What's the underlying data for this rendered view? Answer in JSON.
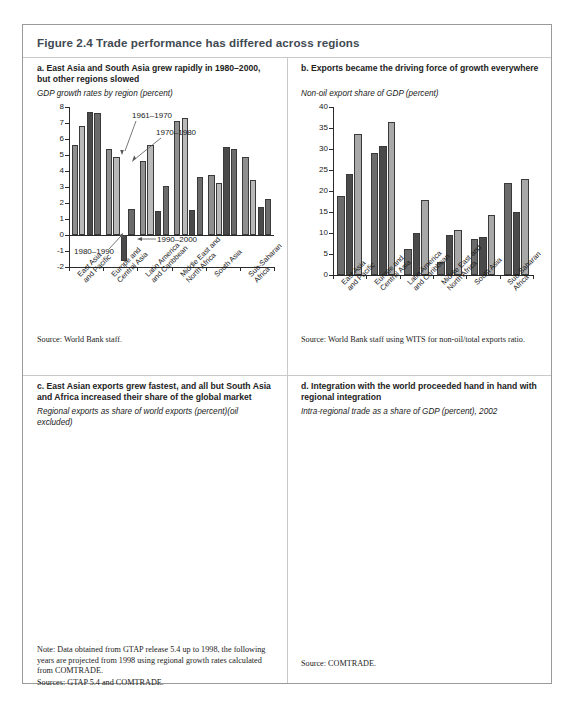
{
  "figure": {
    "title": "Figure 2.4  Trade performance has differed across regions"
  },
  "panel_a": {
    "title": "a. East Asia and South Asia grew rapidly in 1980–2000, but other regions slowed",
    "subtitle": "GDP growth rates by region (percent)",
    "source": "Source: World Bank staff.",
    "annotations": [
      "1961–1970",
      "1970–1980",
      "1980–1990",
      "1990–2000"
    ]
  },
  "panel_b": {
    "title": "b. Exports became the driving force of growth everywhere",
    "subtitle": "Non-oil export share of GDP (percent)",
    "source": "Source: World Bank staff using WITS for non-oil/total exports ratio.",
    "annotations": [
      "1980",
      "1990",
      "2000"
    ]
  },
  "panel_c": {
    "title": "c. East Asian exports grew fastest, and all but South Asia and Africa increased their share of the global market",
    "subtitle": "Regional exports as share of world exports (percent)(oil excluded)",
    "note": "Note: Data obtained from GTAP release 5.4 up to 1998, the following years are projected from 1998 using regional growth rates calculated from COMTRADE.",
    "sources": "Sources: GTAP 5.4 and COMTRADE."
  },
  "panel_d": {
    "title": "d. Integration with the world proceeded hand in hand with regional integration",
    "subtitle": "Intra-regional trade as a share of GDP (percent), 2002",
    "source": "Source: COMTRADE."
  },
  "chart_data": [
    {
      "id": "a",
      "type": "bar",
      "title": "GDP growth rates by region (percent)",
      "xlabel": "",
      "ylabel": "",
      "ylim": [
        -2,
        8
      ],
      "yticks": [
        -2,
        -1,
        0,
        1,
        2,
        3,
        4,
        5,
        6,
        7,
        8
      ],
      "categories": [
        "East Asia and Pacific",
        "Europe and Central Asia",
        "Latin America and Caribbean",
        "Middle East and North Africa",
        "South Asia",
        "Sub-Saharan Africa"
      ],
      "series": [
        {
          "name": "1961–1970",
          "color": "#8f8f8f",
          "values": [
            5.6,
            5.35,
            4.65,
            7.15,
            3.75,
            4.9
          ]
        },
        {
          "name": "1970–1980",
          "color": "#b9b9b9",
          "values": [
            6.8,
            4.9,
            5.6,
            7.3,
            3.25,
            3.45
          ]
        },
        {
          "name": "1980–1990",
          "color": "#4a4a4a",
          "values": [
            7.7,
            -1.65,
            1.5,
            1.55,
            5.5,
            1.75
          ]
        },
        {
          "name": "1990–2000",
          "color": "#6b6b6b",
          "values": [
            7.6,
            1.65,
            3.05,
            3.6,
            5.35,
            2.25
          ]
        }
      ],
      "grid": false,
      "legend": "inline-annotations"
    },
    {
      "id": "b",
      "type": "bar",
      "title": "Non-oil export share of GDP (percent)",
      "xlabel": "",
      "ylabel": "",
      "ylim": [
        0,
        40
      ],
      "yticks": [
        0,
        5,
        10,
        15,
        20,
        25,
        30,
        35,
        40
      ],
      "categories": [
        "East Asia and Pacific",
        "Europe and Central Asia",
        "Latin America and Caribbean",
        "Middle East and North Africa",
        "South Asia",
        "Sub-Saharan Africa"
      ],
      "series": [
        {
          "name": "1980",
          "color": "#6b6b6b",
          "values": [
            18.8,
            29.0,
            6.3,
            3.0,
            8.6,
            21.8
          ]
        },
        {
          "name": "1990",
          "color": "#4a4a4a",
          "values": [
            24.0,
            30.7,
            10.1,
            9.5,
            9.1,
            15.0
          ]
        },
        {
          "name": "2000",
          "color": "#a8a8a8",
          "values": [
            33.6,
            36.5,
            17.9,
            10.6,
            14.2,
            22.9
          ]
        }
      ],
      "grid": false,
      "legend": "inline-annotations"
    },
    {
      "id": "c",
      "type": "line",
      "title": "Regional exports as share of world exports (percent)(oil excluded)",
      "xlabel": "",
      "ylabel": "",
      "ylim": [
        0,
        14
      ],
      "yticks": [
        0,
        2,
        4,
        6,
        8,
        10,
        12,
        14
      ],
      "x": [
        1980,
        1981,
        1982,
        1983,
        1984,
        1985,
        1986,
        1987,
        1988,
        1989,
        1990,
        1991,
        1992,
        1993,
        1994,
        1995,
        1996,
        1997,
        1998,
        1999,
        2000,
        2001,
        2002
      ],
      "xticks": [
        1980,
        1982,
        1984,
        1986,
        1988,
        1990,
        1992,
        1994,
        1996,
        1998,
        2000,
        2002
      ],
      "series": [
        {
          "name": "East Asia and Pacific",
          "color": "#9e9e9e",
          "values": [
            3.4,
            3.5,
            3.5,
            3.6,
            3.8,
            3.7,
            3.8,
            4.1,
            4.5,
            4.8,
            5.2,
            5.6,
            6.1,
            6.6,
            7.3,
            8.1,
            8.7,
            9.2,
            9.2,
            9.6,
            11.0,
            12.0,
            11.8
          ]
        },
        {
          "name": "Latin America and Caribbean",
          "color": "#a6a6a6",
          "values": [
            4.0,
            4.2,
            4.4,
            4.6,
            4.9,
            4.4,
            3.9,
            3.9,
            4.0,
            4.2,
            4.2,
            4.2,
            4.3,
            4.4,
            4.4,
            4.5,
            4.6,
            4.9,
            5.1,
            5.3,
            5.5,
            5.7,
            5.75
          ]
        },
        {
          "name": "Europe and Central Asia",
          "color": "#1f1f1f",
          "values": [
            0.75,
            0.78,
            0.8,
            0.82,
            0.85,
            0.88,
            0.9,
            0.92,
            0.95,
            0.95,
            0.95,
            0.95,
            1.85,
            1.95,
            2.0,
            2.1,
            3.0,
            2.9,
            3.1,
            3.2,
            3.3,
            3.6,
            3.85
          ]
        },
        {
          "name": "Middle East and North Africa",
          "color": "#7a7a7a",
          "values": [
            2.1,
            1.9,
            1.85,
            2.1,
            2.15,
            2.1,
            1.9,
            2.0,
            1.9,
            2.0,
            1.9,
            1.0,
            1.0,
            1.05,
            1.3,
            1.35,
            3.0,
            1.85,
            2.6,
            2.6,
            2.8,
            3.0,
            3.25
          ]
        },
        {
          "name": "Sub-Saharan Africa",
          "color": "#8c8c8c",
          "values": [
            2.1,
            1.9,
            1.85,
            2.1,
            2.15,
            2.1,
            1.9,
            2.0,
            1.9,
            2.0,
            1.9,
            1.2,
            1.2,
            1.2,
            1.3,
            1.35,
            1.4,
            1.4,
            1.45,
            1.5,
            1.55,
            1.6,
            1.6
          ]
        },
        {
          "name": "South Asia",
          "color": "#bdbdbd",
          "values": [
            0.9,
            0.88,
            0.86,
            0.85,
            0.86,
            0.88,
            0.9,
            0.92,
            0.95,
            0.95,
            0.95,
            0.95,
            1.0,
            1.05,
            1.1,
            1.15,
            1.2,
            1.25,
            1.25,
            1.3,
            1.3,
            1.35,
            1.35
          ]
        }
      ],
      "grid": false,
      "legend": "inline-labels"
    },
    {
      "id": "d",
      "type": "bar",
      "title": "Intra-regional trade as a share of GDP (percent), 2002",
      "xlabel": "",
      "ylabel": "",
      "ylim": [
        0,
        30
      ],
      "yticks": [
        0,
        5,
        10,
        15,
        20,
        25,
        30
      ],
      "categories": [
        "East Asia and Pacific",
        "Europe and Central Asia",
        "Latin America and Caribbean",
        "Middle East and North Africa",
        "South Asia",
        "Sub-Saharan Africa"
      ],
      "values": [
        26.5,
        15.3,
        6.4,
        3.5,
        0.8,
        5.3
      ],
      "bar_labels": [
        "26.5",
        "15.3",
        "6.4",
        "3.5",
        "0.8",
        "5.3"
      ],
      "color": "#5d5d5d",
      "grid": false,
      "legend": "none"
    }
  ]
}
